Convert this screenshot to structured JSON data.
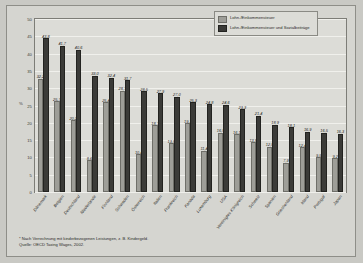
{
  "chart_data": {
    "type": "bar",
    "title": "",
    "xlabel": "",
    "ylabel": "%",
    "ylim": [
      0,
      50
    ],
    "yticks": [
      0,
      5,
      10,
      15,
      20,
      25,
      30,
      35,
      40,
      45,
      50
    ],
    "ytick_labels": [
      "0",
      "5",
      "10",
      "15",
      "20",
      "25",
      "30",
      "35",
      "40",
      "45",
      "50"
    ],
    "grid": true,
    "legend_position": "top-right",
    "categories": [
      "Dänemark",
      "Belgien",
      "Deutschland",
      "Niederlande",
      "Finnland",
      "Schweden",
      "Österreich",
      "Italien",
      "Frankreich",
      "Kanada",
      "Luxemburg",
      "USA",
      "Vereinigtes Königreich",
      "Schweiz",
      "Spanien",
      "Griechenland",
      "Irland",
      "Portugal",
      "Japan"
    ],
    "series": [
      {
        "name": "Lohn-/Einkommensteuer",
        "color": "#9e9e98",
        "values": [
          32.2,
          25.7,
          20.2,
          8.6,
          25.4,
          28.7,
          10.4,
          18.7,
          13.5,
          19.3,
          11.4,
          16.5,
          16.1,
          13.8,
          12.5,
          7.9,
          12.4,
          9.5,
          9.2
        ],
        "value_labels": [
          "32,2",
          "25,7",
          "20,2",
          "8,6",
          "25,4",
          "28,7",
          "10,4",
          "18,7",
          "13,5",
          "19,3",
          "11,4",
          "16,5",
          "16,1",
          "13,8",
          "12,5",
          "7,9",
          "12,4",
          "9,5",
          "9,2"
        ]
      },
      {
        "name": "Lohn-/Einkommensteuer und Sozialbeiträge",
        "color": "#3b3b38",
        "values": [
          43.8,
          41.7,
          40.6,
          33.0,
          32.4,
          31.7,
          28.5,
          27.9,
          27.0,
          25.3,
          24.8,
          24.6,
          23.3,
          21.4,
          18.9,
          18.1,
          16.9,
          16.5,
          16.3
        ],
        "value_labels": [
          "43,8",
          "41,7",
          "40,6",
          "33,0",
          "32,4",
          "31,7",
          "28,5",
          "27,9",
          "27,0",
          "25,3",
          "24,8",
          "24,6",
          "23,3",
          "21,4",
          "18,9",
          "18,1",
          "16,9",
          "16,5",
          "16,3"
        ]
      }
    ]
  },
  "legend": {
    "items": [
      {
        "label": "Lohn-/Einkommensteuer"
      },
      {
        "label": "Lohn-/Einkommensteuer und Sozialbeiträge"
      }
    ]
  },
  "footnotes": {
    "line1": "*  Nach Verrechnung mit kinderbezogenen Leistungen, z. B. Kindergeld.",
    "line2": "Quelle: OECD Taxing Wages, 2002."
  }
}
